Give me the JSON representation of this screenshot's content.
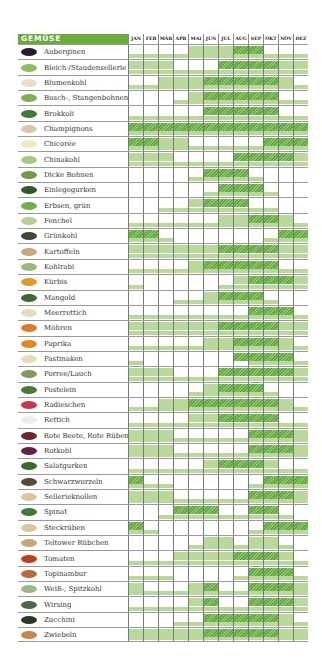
{
  "chart_data": {
    "type": "heatmap",
    "title": "GEMÜSE",
    "legend": {
      "0": "nicht verfügbar",
      "1": "verfügbar (hellgrün)",
      "2": "Hauptsaison (schraffiert)"
    },
    "months": [
      "JAN",
      "FEB",
      "MÄR",
      "APR",
      "MAI",
      "JUN",
      "JUL",
      "AUG",
      "SEP",
      "OKT",
      "NOV",
      "DEZ"
    ],
    "colors": {
      "header": "#6aab3a",
      "light": "#b9d99a",
      "hatch_dark": "#5fa83d",
      "hatch_light": "#8cc46a",
      "grid": "#777777"
    },
    "rows": [
      {
        "name": "Auberginen",
        "icon": "aubergine-icon",
        "color": "#2a1a2e",
        "top": [
          0,
          0,
          0,
          0,
          1,
          1,
          1,
          2,
          2,
          0,
          0,
          0
        ],
        "bottom": [
          1,
          1,
          1,
          1,
          1,
          1,
          1,
          1,
          1,
          1,
          1,
          1
        ]
      },
      {
        "name": "Bleich-/Staudensellerie",
        "icon": "celery-icon",
        "color": "#8fbf5a",
        "top": [
          1,
          1,
          1,
          0,
          0,
          0,
          2,
          2,
          2,
          2,
          1,
          1
        ],
        "bottom": [
          1,
          1,
          1,
          1,
          1,
          1,
          1,
          1,
          1,
          1,
          1,
          1
        ]
      },
      {
        "name": "Blumenkohl",
        "icon": "cauliflower-icon",
        "color": "#e8e0c8",
        "top": [
          0,
          0,
          1,
          1,
          1,
          2,
          2,
          2,
          2,
          2,
          1,
          0
        ],
        "bottom": [
          1,
          1,
          1,
          1,
          1,
          1,
          1,
          1,
          1,
          1,
          1,
          1
        ]
      },
      {
        "name": "Busch-, Stangenbohnen",
        "icon": "beans-icon",
        "color": "#7fae55",
        "top": [
          0,
          0,
          0,
          0,
          1,
          2,
          2,
          2,
          2,
          2,
          0,
          0
        ],
        "bottom": [
          0,
          0,
          0,
          1,
          1,
          1,
          1,
          1,
          1,
          1,
          1,
          1
        ]
      },
      {
        "name": "Brokkoli",
        "icon": "broccoli-icon",
        "color": "#3e7a3a",
        "top": [
          0,
          0,
          0,
          0,
          0,
          2,
          2,
          2,
          2,
          2,
          0,
          0
        ],
        "bottom": [
          1,
          1,
          1,
          1,
          1,
          1,
          1,
          1,
          1,
          1,
          1,
          1
        ]
      },
      {
        "name": "Champignons",
        "icon": "mushroom-icon",
        "color": "#d9c9a8",
        "top": [
          2,
          2,
          2,
          2,
          2,
          2,
          2,
          2,
          2,
          2,
          2,
          2
        ],
        "bottom": [
          1,
          1,
          1,
          1,
          1,
          1,
          1,
          1,
          1,
          1,
          1,
          1
        ]
      },
      {
        "name": "Chicorée",
        "icon": "chicory-icon",
        "color": "#efe9c8",
        "top": [
          2,
          2,
          1,
          1,
          0,
          0,
          0,
          0,
          0,
          2,
          2,
          2
        ],
        "bottom": [
          1,
          1,
          1,
          1,
          1,
          1,
          1,
          1,
          1,
          1,
          1,
          1
        ]
      },
      {
        "name": "Chinakohl",
        "icon": "chinese-cabbage-icon",
        "color": "#a8c88a",
        "top": [
          1,
          1,
          1,
          0,
          0,
          0,
          0,
          2,
          2,
          2,
          2,
          1
        ],
        "bottom": [
          1,
          1,
          1,
          1,
          1,
          1,
          1,
          1,
          1,
          1,
          1,
          1
        ]
      },
      {
        "name": "Dicke Bohnen",
        "icon": "broad-beans-icon",
        "color": "#6f9a4a",
        "top": [
          0,
          0,
          0,
          0,
          0,
          2,
          2,
          2,
          0,
          0,
          0,
          0
        ],
        "bottom": [
          0,
          0,
          0,
          0,
          1,
          1,
          1,
          1,
          1,
          0,
          0,
          0
        ]
      },
      {
        "name": "Einlegegurken",
        "icon": "pickle-icon",
        "color": "#2f5a2a",
        "top": [
          0,
          0,
          0,
          0,
          0,
          0,
          2,
          2,
          2,
          0,
          0,
          0
        ],
        "bottom": [
          0,
          0,
          0,
          0,
          0,
          1,
          1,
          1,
          1,
          1,
          0,
          0
        ]
      },
      {
        "name": "Erbsen, grün",
        "icon": "peas-icon",
        "color": "#6fb04a",
        "top": [
          0,
          0,
          0,
          0,
          1,
          2,
          2,
          2,
          0,
          0,
          0,
          0
        ],
        "bottom": [
          0,
          0,
          1,
          1,
          1,
          1,
          1,
          1,
          1,
          1,
          0,
          0
        ]
      },
      {
        "name": "Fenchel",
        "icon": "fennel-icon",
        "color": "#b6cf96",
        "top": [
          0,
          0,
          0,
          0,
          0,
          0,
          1,
          1,
          2,
          2,
          1,
          0
        ],
        "bottom": [
          1,
          1,
          1,
          1,
          1,
          1,
          1,
          1,
          1,
          1,
          1,
          1
        ]
      },
      {
        "name": "Grünkohl",
        "icon": "kale-icon",
        "color": "#3c4a36",
        "top": [
          2,
          2,
          0,
          0,
          0,
          0,
          0,
          0,
          0,
          0,
          2,
          2
        ],
        "bottom": [
          1,
          1,
          1,
          0,
          0,
          0,
          0,
          0,
          0,
          1,
          1,
          1
        ]
      },
      {
        "name": "Kartoffeln",
        "icon": "potato-icon",
        "color": "#c9a87a",
        "top": [
          1,
          1,
          1,
          1,
          1,
          1,
          2,
          2,
          2,
          2,
          1,
          1
        ],
        "bottom": [
          1,
          1,
          1,
          1,
          1,
          1,
          1,
          1,
          1,
          1,
          1,
          1
        ]
      },
      {
        "name": "Kohlrabi",
        "icon": "kohlrabi-icon",
        "color": "#9ab87a",
        "top": [
          0,
          0,
          0,
          0,
          1,
          2,
          2,
          2,
          2,
          2,
          0,
          0
        ],
        "bottom": [
          1,
          1,
          1,
          1,
          1,
          1,
          1,
          1,
          1,
          1,
          1,
          1
        ]
      },
      {
        "name": "Kürbis",
        "icon": "pumpkin-icon",
        "color": "#e09a2a",
        "top": [
          0,
          0,
          0,
          0,
          0,
          0,
          0,
          1,
          2,
          2,
          2,
          1
        ],
        "bottom": [
          1,
          0,
          0,
          0,
          0,
          0,
          1,
          1,
          1,
          1,
          1,
          1
        ]
      },
      {
        "name": "Mangold",
        "icon": "chard-icon",
        "color": "#3e6a32",
        "top": [
          0,
          0,
          0,
          0,
          0,
          1,
          2,
          2,
          2,
          0,
          0,
          0
        ],
        "bottom": [
          0,
          0,
          0,
          1,
          1,
          1,
          1,
          1,
          1,
          1,
          0,
          0
        ]
      },
      {
        "name": "Meerrettich",
        "icon": "horseradish-icon",
        "color": "#e6dcc0",
        "top": [
          0,
          0,
          0,
          0,
          0,
          0,
          0,
          0,
          2,
          2,
          2,
          0
        ],
        "bottom": [
          1,
          1,
          1,
          1,
          1,
          1,
          1,
          1,
          1,
          1,
          1,
          1
        ]
      },
      {
        "name": "Möhren",
        "icon": "carrot-icon",
        "color": "#e07a2a",
        "top": [
          1,
          1,
          1,
          1,
          1,
          1,
          2,
          2,
          2,
          2,
          1,
          1
        ],
        "bottom": [
          1,
          1,
          1,
          1,
          1,
          1,
          1,
          1,
          1,
          1,
          1,
          1
        ]
      },
      {
        "name": "Paprika",
        "icon": "pepper-icon",
        "color": "#e08a1a",
        "top": [
          0,
          0,
          0,
          0,
          0,
          1,
          1,
          2,
          2,
          2,
          1,
          0
        ],
        "bottom": [
          1,
          1,
          1,
          1,
          1,
          1,
          1,
          1,
          1,
          1,
          1,
          1
        ]
      },
      {
        "name": "Pastinaken",
        "icon": "parsnip-icon",
        "color": "#e8dcb8",
        "top": [
          0,
          0,
          0,
          0,
          0,
          0,
          0,
          2,
          2,
          2,
          2,
          0
        ],
        "bottom": [
          1,
          0,
          0,
          0,
          0,
          0,
          0,
          0,
          1,
          1,
          1,
          1
        ]
      },
      {
        "name": "Porree/Lauch",
        "icon": "leek-icon",
        "color": "#7f9a5a",
        "top": [
          1,
          1,
          1,
          0,
          0,
          0,
          2,
          2,
          2,
          2,
          2,
          1
        ],
        "bottom": [
          1,
          1,
          1,
          1,
          1,
          1,
          1,
          1,
          1,
          1,
          1,
          1
        ]
      },
      {
        "name": "Postelein",
        "icon": "purslane-icon",
        "color": "#4a7a3a",
        "top": [
          0,
          0,
          0,
          0,
          0,
          1,
          2,
          2,
          2,
          0,
          0,
          0
        ],
        "bottom": [
          0,
          0,
          0,
          0,
          1,
          1,
          1,
          1,
          1,
          1,
          0,
          0
        ]
      },
      {
        "name": "Radieschen",
        "icon": "radish-icon",
        "color": "#c8384a",
        "top": [
          0,
          0,
          1,
          1,
          2,
          2,
          2,
          2,
          2,
          2,
          1,
          0
        ],
        "bottom": [
          1,
          1,
          1,
          1,
          1,
          1,
          1,
          1,
          1,
          1,
          1,
          1
        ]
      },
      {
        "name": "Rettich",
        "icon": "white-radish-icon",
        "color": "#eeeeea",
        "top": [
          0,
          0,
          0,
          0,
          1,
          1,
          2,
          2,
          2,
          2,
          0,
          0
        ],
        "bottom": [
          1,
          1,
          1,
          1,
          1,
          1,
          1,
          1,
          1,
          1,
          1,
          1
        ]
      },
      {
        "name": "Rote Beete, Rote Rüben",
        "icon": "beetroot-icon",
        "color": "#6a2a2a",
        "top": [
          1,
          1,
          1,
          0,
          0,
          0,
          0,
          0,
          2,
          2,
          2,
          1
        ],
        "bottom": [
          1,
          1,
          1,
          1,
          1,
          1,
          1,
          1,
          1,
          1,
          1,
          1
        ]
      },
      {
        "name": "Rotkohl",
        "icon": "red-cabbage-icon",
        "color": "#6a2040",
        "top": [
          1,
          1,
          1,
          0,
          0,
          0,
          0,
          0,
          2,
          2,
          2,
          1
        ],
        "bottom": [
          1,
          1,
          1,
          1,
          1,
          1,
          1,
          1,
          1,
          1,
          1,
          1
        ]
      },
      {
        "name": "Salatgurken",
        "icon": "cucumber-icon",
        "color": "#3a6a2a",
        "top": [
          0,
          0,
          0,
          0,
          0,
          1,
          2,
          2,
          2,
          1,
          0,
          0
        ],
        "bottom": [
          1,
          1,
          1,
          1,
          1,
          1,
          1,
          1,
          1,
          1,
          1,
          1
        ]
      },
      {
        "name": "Schwarzwurzeln",
        "icon": "salsify-icon",
        "color": "#5a4a3a",
        "top": [
          2,
          0,
          0,
          0,
          0,
          0,
          0,
          0,
          0,
          2,
          2,
          2
        ],
        "bottom": [
          1,
          1,
          1,
          0,
          0,
          0,
          0,
          0,
          1,
          1,
          1,
          1
        ]
      },
      {
        "name": "Sellerieknollen",
        "icon": "celeriac-icon",
        "color": "#d8c898",
        "top": [
          1,
          1,
          1,
          0,
          0,
          0,
          0,
          0,
          2,
          2,
          2,
          1
        ],
        "bottom": [
          1,
          1,
          1,
          1,
          1,
          1,
          1,
          1,
          1,
          1,
          1,
          1
        ]
      },
      {
        "name": "Spinat",
        "icon": "spinach-icon",
        "color": "#3e7a3a",
        "top": [
          0,
          0,
          0,
          2,
          2,
          2,
          0,
          0,
          2,
          2,
          0,
          0
        ],
        "bottom": [
          0,
          0,
          1,
          1,
          1,
          1,
          1,
          1,
          1,
          1,
          1,
          0
        ]
      },
      {
        "name": "Steckrüben",
        "icon": "swede-icon",
        "color": "#d8c8a0",
        "top": [
          2,
          0,
          0,
          0,
          0,
          0,
          0,
          0,
          0,
          2,
          2,
          2
        ],
        "bottom": [
          1,
          1,
          0,
          0,
          0,
          0,
          0,
          0,
          1,
          1,
          1,
          1
        ]
      },
      {
        "name": "Teltower Rübchen",
        "icon": "teltow-turnip-icon",
        "color": "#c8a878",
        "top": [
          0,
          0,
          0,
          0,
          0,
          1,
          1,
          0,
          1,
          1,
          0,
          0
        ],
        "bottom": [
          0,
          0,
          0,
          0,
          1,
          1,
          1,
          1,
          1,
          1,
          1,
          0
        ]
      },
      {
        "name": "Tomaten",
        "icon": "tomato-icon",
        "color": "#c83a1a",
        "top": [
          0,
          0,
          0,
          1,
          1,
          1,
          1,
          2,
          2,
          2,
          1,
          0
        ],
        "bottom": [
          1,
          1,
          1,
          1,
          1,
          1,
          1,
          1,
          1,
          1,
          1,
          1
        ]
      },
      {
        "name": "Topinambur",
        "icon": "jerusalem-artichoke-icon",
        "color": "#b86a3a",
        "top": [
          0,
          0,
          0,
          0,
          0,
          0,
          0,
          0,
          2,
          2,
          2,
          0
        ],
        "bottom": [
          1,
          1,
          1,
          0,
          0,
          0,
          0,
          1,
          1,
          1,
          1,
          1
        ]
      },
      {
        "name": "Weiß-, Spitzkohl",
        "icon": "white-cabbage-icon",
        "color": "#9ab88a",
        "top": [
          1,
          0,
          0,
          0,
          1,
          2,
          0,
          0,
          2,
          2,
          2,
          1
        ],
        "bottom": [
          1,
          1,
          1,
          1,
          1,
          1,
          1,
          1,
          1,
          1,
          1,
          1
        ]
      },
      {
        "name": "Wirsing",
        "icon": "savoy-cabbage-icon",
        "color": "#4a6a4a",
        "top": [
          0,
          0,
          0,
          0,
          1,
          2,
          0,
          0,
          2,
          2,
          2,
          1
        ],
        "bottom": [
          1,
          1,
          1,
          1,
          1,
          1,
          1,
          1,
          1,
          1,
          1,
          1
        ]
      },
      {
        "name": "Zucchini",
        "icon": "zucchini-icon",
        "color": "#2a3a22",
        "top": [
          0,
          0,
          0,
          0,
          0,
          2,
          2,
          2,
          2,
          2,
          1,
          0
        ],
        "bottom": [
          0,
          0,
          0,
          1,
          1,
          1,
          1,
          1,
          1,
          1,
          1,
          1
        ]
      },
      {
        "name": "Zwiebeln",
        "icon": "onion-icon",
        "color": "#c8864a",
        "top": [
          1,
          1,
          1,
          1,
          1,
          2,
          2,
          2,
          2,
          2,
          1,
          1
        ],
        "bottom": [
          1,
          1,
          1,
          1,
          1,
          1,
          1,
          1,
          1,
          1,
          1,
          1
        ]
      }
    ]
  },
  "header": {
    "title": "GEMÜSE"
  }
}
